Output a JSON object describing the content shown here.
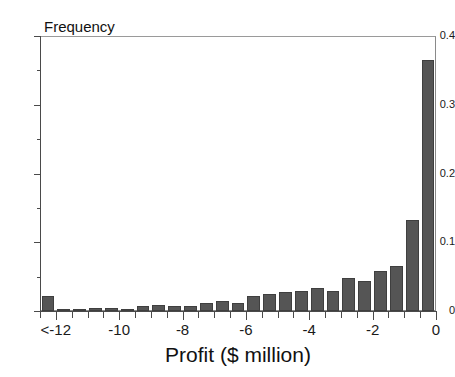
{
  "figure": {
    "background_color": "#ffffff",
    "bar_color": "#555555",
    "bar_edge_color": "#3f3f3f",
    "axis_color": "#4a4a4a"
  },
  "axes": {
    "y_title": "Frequency",
    "x_title": "Profit ($ million)",
    "y_ticks": [
      "0",
      "0.1",
      "0.2",
      "0.3",
      "0.4"
    ],
    "y_tick_values": [
      0,
      0.1,
      0.2,
      0.3,
      0.4
    ],
    "y_minor_tick_values": [
      0.05,
      0.15,
      0.25,
      0.35
    ],
    "x_ticks": [
      "<-12",
      "-10",
      "-8",
      "-6",
      "-4",
      "-2",
      "0"
    ],
    "x_tick_values": [
      -12,
      -10,
      -8,
      -6,
      -4,
      -2,
      0
    ]
  },
  "chart_data": {
    "type": "bar",
    "title": "",
    "subtitle": "",
    "xlabel": "Profit ($ million)",
    "ylabel": "Frequency",
    "xlim": [
      -12.5,
      0
    ],
    "ylim": [
      0,
      0.4
    ],
    "grid": false,
    "legend": null,
    "bin_width": 0.5,
    "categories": [
      "<-12",
      "-12.0",
      "-11.5",
      "-11.0",
      "-10.5",
      "-10.0",
      "-9.5",
      "-9.0",
      "-8.5",
      "-8.0",
      "-7.5",
      "-7.0",
      "-6.5",
      "-6.0",
      "-5.5",
      "-5.0",
      "-4.5",
      "-4.0",
      "-3.5",
      "-3.0",
      "-2.5",
      "-2.0",
      "-1.5",
      "-1.0",
      "-0.5"
    ],
    "bin_left_edges": [
      -12.5,
      -12.0,
      -11.5,
      -11.0,
      -10.5,
      -10.0,
      -9.5,
      -9.0,
      -8.5,
      -8.0,
      -7.5,
      -7.0,
      -6.5,
      -6.0,
      -5.5,
      -5.0,
      -4.5,
      -4.0,
      -3.5,
      -3.0,
      -2.5,
      -2.0,
      -1.5,
      -1.0,
      -0.5
    ],
    "values": [
      0.022,
      0.002,
      0.002,
      0.004,
      0.004,
      0.002,
      0.007,
      0.009,
      0.007,
      0.007,
      0.012,
      0.015,
      0.012,
      0.022,
      0.025,
      0.027,
      0.029,
      0.034,
      0.029,
      0.048,
      0.044,
      0.058,
      0.066,
      0.133,
      0.365
    ]
  }
}
